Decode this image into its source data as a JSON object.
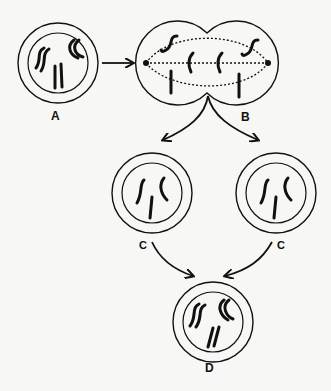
{
  "diagram": {
    "type": "cell-division-cycle",
    "colors": {
      "background": "#f7f7f5",
      "ink": "#111111"
    },
    "labels": {
      "A": "A",
      "B": "B",
      "C_left": "C",
      "C_right": "C",
      "D": "D"
    },
    "nodes": [
      {
        "id": "A",
        "description": "cell with nucleus, 3 chromosome pairs"
      },
      {
        "id": "B",
        "description": "dividing cell with spindle fibers and chromosomes separating"
      },
      {
        "id": "C_left",
        "description": "daughter cell with 3 single chromosomes"
      },
      {
        "id": "C_right",
        "description": "daughter cell with 3 single chromosomes"
      },
      {
        "id": "D",
        "description": "cell with 3 chromosome pairs"
      }
    ],
    "edges": [
      {
        "from": "A",
        "to": "B"
      },
      {
        "from": "B",
        "to": "C_left"
      },
      {
        "from": "B",
        "to": "C_right"
      },
      {
        "from": "C_left",
        "to": "D"
      },
      {
        "from": "C_right",
        "to": "D"
      }
    ]
  }
}
